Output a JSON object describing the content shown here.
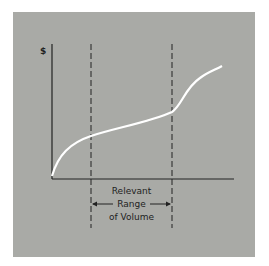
{
  "diagram": {
    "y_axis_label": "$",
    "range_label_line1": "Relevant",
    "range_label_line2": "Range",
    "range_label_line3": "of Volume",
    "colors": {
      "background": "#a9aaa6",
      "curve": "#ffffff",
      "axis": "#222222"
    }
  }
}
